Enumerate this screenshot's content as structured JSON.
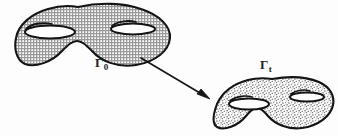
{
  "figure": {
    "background_color": "#fdfdfd",
    "ink_color": "#1a1a1a",
    "labels": {
      "source": {
        "symbol": "Γ",
        "subscript": "0",
        "x": 95,
        "y": 54
      },
      "target": {
        "symbol": "Γ",
        "subscript": "t",
        "x": 260,
        "y": 56
      }
    },
    "shapes": [
      {
        "name": "genus-2-surface-source",
        "label": "Γ₀",
        "genus": 2,
        "fill_pattern": "fine-crosshatch-grid",
        "fill_color": "#c9c9c9",
        "stroke_color": "#141414",
        "stroke_width": 2.1,
        "bbox": {
          "x": 14,
          "y": 5,
          "width": 158,
          "height": 62
        },
        "holes": 2
      },
      {
        "name": "genus-2-surface-target",
        "label": "Γₜ",
        "genus": 2,
        "fill_pattern": "stipple-speckle",
        "fill_color": "#b8b8b8",
        "stroke_color": "#141414",
        "stroke_width": 2.1,
        "bbox": {
          "x": 214,
          "y": 78,
          "width": 120,
          "height": 52
        },
        "holes": 2
      }
    ],
    "arrow": {
      "name": "deformation-arrow",
      "from": {
        "x": 141,
        "y": 58
      },
      "to": {
        "x": 209,
        "y": 99
      },
      "stroke_color": "#161616",
      "stroke_width": 1.7,
      "head": "solid-triangle"
    }
  }
}
